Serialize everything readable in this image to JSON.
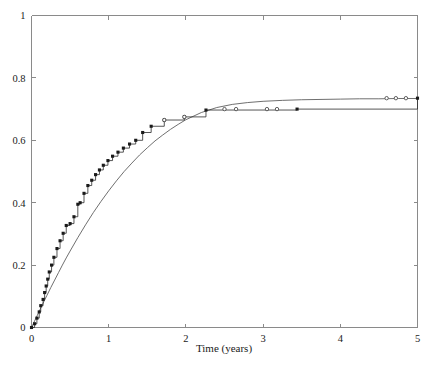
{
  "chart_data": {
    "type": "line",
    "title": "",
    "subtitle": "",
    "xlabel": "Time (years)",
    "ylabel": "",
    "xlim": [
      0,
      5
    ],
    "ylim": [
      0,
      1
    ],
    "grid": false,
    "legend": null,
    "xticks": [
      0,
      1,
      2,
      3,
      4,
      5
    ],
    "xticklabels": [
      "0",
      "1",
      "2",
      "3",
      "4",
      "5"
    ],
    "yticks": [
      0,
      0.2,
      0.4,
      0.6,
      0.8,
      1
    ],
    "yticklabels": [
      "0",
      "0.2",
      "0.4",
      "0.6",
      "0.8",
      "1"
    ],
    "series": [
      {
        "name": "Kaplan-Meier step estimate",
        "type": "step",
        "marker": "filled-square",
        "color": "#1a1a1a",
        "x": [
          0.0,
          0.04,
          0.07,
          0.1,
          0.12,
          0.15,
          0.17,
          0.19,
          0.21,
          0.23,
          0.26,
          0.29,
          0.33,
          0.37,
          0.41,
          0.45,
          0.5,
          0.55,
          0.6,
          0.63,
          0.68,
          0.73,
          0.78,
          0.83,
          0.88,
          0.93,
          0.99,
          1.05,
          1.12,
          1.19,
          1.27,
          1.35,
          1.44,
          1.55,
          1.72,
          1.98,
          2.26,
          3.44,
          5.0
        ],
        "y": [
          0.0,
          0.012,
          0.03,
          0.05,
          0.07,
          0.09,
          0.112,
          0.133,
          0.155,
          0.178,
          0.2,
          0.225,
          0.253,
          0.278,
          0.302,
          0.327,
          0.333,
          0.355,
          0.395,
          0.4,
          0.43,
          0.455,
          0.472,
          0.49,
          0.505,
          0.52,
          0.535,
          0.549,
          0.562,
          0.575,
          0.588,
          0.6,
          0.625,
          0.645,
          0.665,
          0.675,
          0.697,
          0.7,
          0.735
        ]
      },
      {
        "name": "Smooth parametric fit",
        "type": "line",
        "marker": "none",
        "color": "#5f5f5f",
        "x": [
          0.0,
          0.05,
          0.1,
          0.15,
          0.2,
          0.25,
          0.3,
          0.35,
          0.4,
          0.45,
          0.5,
          0.6,
          0.7,
          0.8,
          0.9,
          1.0,
          1.1,
          1.2,
          1.3,
          1.4,
          1.5,
          1.6,
          1.7,
          1.8,
          1.9,
          2.0,
          2.2,
          2.4,
          2.6,
          2.8,
          3.0,
          3.25,
          3.5,
          3.75,
          4.0,
          4.25,
          4.5,
          4.75,
          5.0
        ],
        "y": [
          0.0,
          0.026,
          0.052,
          0.078,
          0.103,
          0.128,
          0.152,
          0.176,
          0.2,
          0.223,
          0.245,
          0.288,
          0.329,
          0.368,
          0.404,
          0.438,
          0.47,
          0.5,
          0.527,
          0.553,
          0.576,
          0.598,
          0.617,
          0.635,
          0.651,
          0.666,
          0.689,
          0.705,
          0.715,
          0.721,
          0.725,
          0.728,
          0.73,
          0.731,
          0.732,
          0.733,
          0.733,
          0.734,
          0.734
        ]
      }
    ],
    "censored_points": {
      "name": "Censored observations",
      "marker": "open-circle",
      "color": "#3a3a3a",
      "x": [
        1.72,
        1.98,
        2.5,
        2.65,
        3.05,
        3.18,
        4.6,
        4.72,
        4.85
      ],
      "y": [
        0.665,
        0.675,
        0.7,
        0.7,
        0.7,
        0.7,
        0.735,
        0.735,
        0.735
      ]
    },
    "annotations": []
  },
  "axes": {
    "x_title": "Time (years)",
    "y_title": ""
  }
}
